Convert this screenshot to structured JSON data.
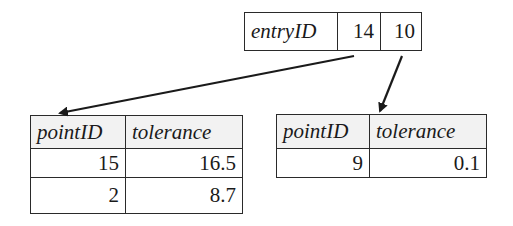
{
  "entry": {
    "label": "entryID",
    "pointers": [
      "14",
      "10"
    ]
  },
  "left_node": {
    "headers": [
      "pointID",
      "tolerance"
    ],
    "rows": [
      [
        "15",
        "16.5"
      ],
      [
        "2",
        "8.7"
      ]
    ]
  },
  "right_node": {
    "headers": [
      "pointID",
      "tolerance"
    ],
    "rows": [
      [
        "9",
        "0.1"
      ]
    ]
  },
  "arrows": [
    {
      "from": "entry.pointers.0",
      "to": "left_node"
    },
    {
      "from": "entry.pointers.1",
      "to": "right_node"
    }
  ]
}
